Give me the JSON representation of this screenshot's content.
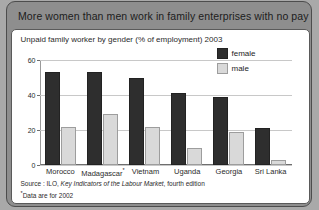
{
  "title": "More women than men work in family enterprises with no pay",
  "subtitle": "Unpaid family worker by gender (% of employment) 2003",
  "legend": {
    "female_label": "female",
    "male_label": "male"
  },
  "footer": {
    "source_prefix": "Source : ILO, ",
    "source_italic": "Key Indicators of the Labour Market",
    "source_suffix": ", fourth edition",
    "footnote_marker": "*",
    "footnote_text": "Data are for 2002"
  },
  "colors": {
    "female": "#2e2e2e",
    "male": "#d9d9d9",
    "title_band": "#8e8e8e",
    "panel": "#ffffff"
  },
  "chart_data": {
    "type": "bar",
    "title": "Unpaid family worker by gender (% of employment) 2003",
    "xlabel": "",
    "ylabel": "",
    "ylim": [
      0,
      60
    ],
    "yticks": [
      0,
      20,
      40,
      60
    ],
    "grid": true,
    "legend_position": "top-right",
    "categories": [
      "Morocco",
      "Madagascar*",
      "Vietnam",
      "Uganda",
      "Georgia",
      "Sri Lanka"
    ],
    "series": [
      {
        "name": "female",
        "values": [
          53,
          53,
          50,
          41,
          39,
          21
        ]
      },
      {
        "name": "male",
        "values": [
          22,
          29,
          22,
          10,
          19,
          3
        ]
      }
    ],
    "annotations": [
      "*Data are for 2002"
    ]
  }
}
